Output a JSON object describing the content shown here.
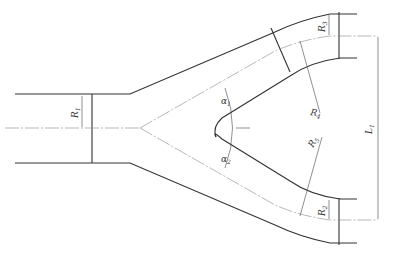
{
  "diagram": {
    "type": "Y-branch pipe (wye) technical drawing",
    "labels": {
      "R1": "R",
      "R1_sub": "1",
      "R2": "R",
      "R2_sub": "2",
      "R3": "R",
      "R3_sub": "3",
      "R4": "R",
      "R4_sub": "4",
      "R5": "R",
      "R5_sub": "5",
      "L1": "L",
      "L1_sub": "1",
      "a1": "α",
      "a1_sub": "1",
      "a2": "α",
      "a2_sub": "2"
    },
    "colors": {
      "outline": "#333333",
      "centerline": "#777777",
      "background": "#ffffff"
    }
  }
}
